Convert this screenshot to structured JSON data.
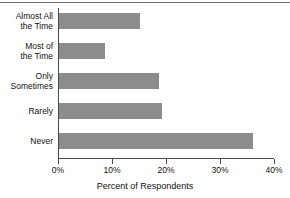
{
  "chart_data": {
    "type": "bar",
    "orientation": "horizontal",
    "title": "",
    "xlabel": "Percent of Respondents",
    "ylabel": "",
    "categories": [
      "Almost All\nthe Time",
      "Most of\nthe Time",
      "Only\nSometimes",
      "Rarely",
      "Never"
    ],
    "category_lines": [
      [
        "Almost All",
        "the Time"
      ],
      [
        "Most of",
        "the Time"
      ],
      [
        "Only",
        "Sometimes"
      ],
      [
        "Rarely"
      ],
      [
        "Never"
      ]
    ],
    "values": [
      15,
      8.5,
      18.5,
      19,
      36
    ],
    "xlim": [
      0,
      40
    ],
    "xticks": [
      0,
      10,
      20,
      30,
      40
    ],
    "xtick_labels": [
      "0%",
      "10%",
      "20%",
      "30%",
      "40%"
    ],
    "grid": false,
    "legend": false,
    "bar_color": "#8c8c8c",
    "axis_color": "#4a4a4a",
    "text_color": "#111111"
  },
  "labels": {
    "cat0_line0": "Almost All",
    "cat0_line1": "the Time",
    "cat1_line0": "Most of",
    "cat1_line1": "the Time",
    "cat2_line0": "Only",
    "cat2_line1": "Sometimes",
    "cat3_line0": "Rarely",
    "cat4_line0": "Never"
  },
  "ticks": {
    "t0": "0%",
    "t1": "10%",
    "t2": "20%",
    "t3": "30%",
    "t4": "40%"
  },
  "axis_title": "Percent of Respondents"
}
